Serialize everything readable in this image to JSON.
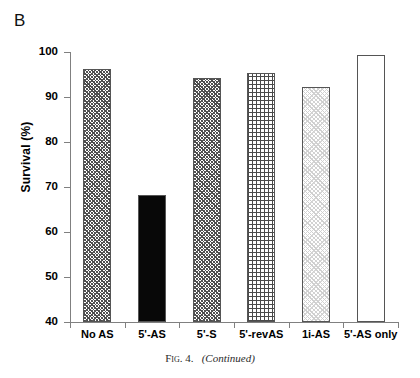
{
  "panel": {
    "label": "B"
  },
  "caption": {
    "fig_prefix": "Fig. 4.",
    "continued": "(Continued)"
  },
  "chart_data": {
    "type": "bar",
    "title": "",
    "xlabel": "",
    "ylabel": "Survival (%)",
    "ylim": [
      40,
      100
    ],
    "yticks": [
      40,
      50,
      60,
      70,
      80,
      90,
      100
    ],
    "ytick_labels": [
      "40",
      "50",
      "60",
      "70",
      "80",
      "90",
      "100"
    ],
    "grid": false,
    "legend": "none",
    "categories": [
      "No AS",
      "5'-AS",
      "5'-S",
      "5'-revAS",
      "1i-AS",
      "5'-AS only"
    ],
    "values": [
      96.2,
      68.2,
      94.2,
      95.3,
      92.2,
      99.3
    ],
    "bar_fills": [
      "hatch-dense",
      "solid-black",
      "hatch-dense",
      "grid",
      "dots-light",
      "empty"
    ],
    "series": [
      {
        "name": "Survival",
        "values": [
          96.2,
          68.2,
          94.2,
          95.3,
          92.2,
          99.3
        ]
      }
    ]
  },
  "colors": {
    "axis": "#808080",
    "bar_outline": "#555555",
    "solid_bar": "#080808",
    "hatch_ink": "#4a4a4a",
    "light_fill": "#d2d2d2",
    "text": "#000000"
  }
}
